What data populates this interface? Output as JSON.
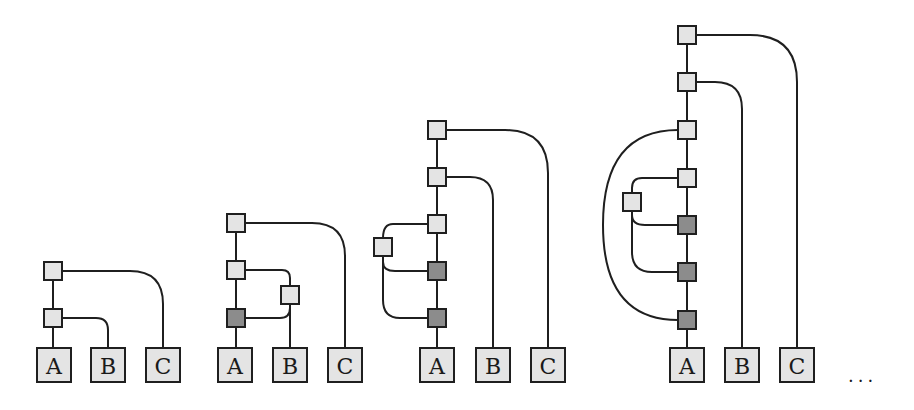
{
  "colors": {
    "stroke": "#1f1f1f",
    "light_node": "#e4e4e4",
    "dark_node": "#8c8c8c",
    "background": "#ffffff"
  },
  "leaf_labels": [
    "A",
    "B",
    "C"
  ],
  "continuation": "...",
  "node_size": 18,
  "leaf_size": 34,
  "leaf_y": 348,
  "diagrams": [
    {
      "id": "d1",
      "leaves": [
        {
          "label": "A",
          "cx": 54
        },
        {
          "label": "B",
          "cx": 108
        },
        {
          "label": "C",
          "cx": 163
        }
      ],
      "nodes": [
        {
          "id": "n1",
          "cx": 53,
          "cy": 271,
          "shade": "light"
        },
        {
          "id": "n2",
          "cx": 53,
          "cy": 318,
          "shade": "light"
        }
      ],
      "edges": [
        "M53,271 L53,348",
        "M62,271 L130,271 Q163,271 163,304 L163,348",
        "M62,318 L96,318 Q108,318 108,330 L108,348"
      ]
    },
    {
      "id": "d2",
      "leaves": [
        {
          "label": "A",
          "cx": 235
        },
        {
          "label": "B",
          "cx": 290
        },
        {
          "label": "C",
          "cx": 345
        }
      ],
      "nodes": [
        {
          "id": "n1",
          "cx": 236,
          "cy": 223,
          "shade": "light"
        },
        {
          "id": "n2",
          "cx": 236,
          "cy": 270,
          "shade": "light"
        },
        {
          "id": "n3",
          "cx": 290,
          "cy": 295,
          "shade": "light"
        },
        {
          "id": "n4",
          "cx": 236,
          "cy": 318,
          "shade": "dark"
        }
      ],
      "edges": [
        "M236,223 L236,348",
        "M245,223 L312,223 Q345,223 345,256 L345,348",
        "M245,270 L282,270 Q290,270 290,278 L290,348",
        "M245,318 L280,318 Q290,318 290,308"
      ]
    },
    {
      "id": "d3",
      "leaves": [
        {
          "label": "A",
          "cx": 437
        },
        {
          "label": "B",
          "cx": 493
        },
        {
          "label": "C",
          "cx": 548
        }
      ],
      "nodes": [
        {
          "id": "n1",
          "cx": 437,
          "cy": 130,
          "shade": "light"
        },
        {
          "id": "n2",
          "cx": 437,
          "cy": 177,
          "shade": "light"
        },
        {
          "id": "n3",
          "cx": 437,
          "cy": 224,
          "shade": "light"
        },
        {
          "id": "n4",
          "cx": 383,
          "cy": 247,
          "shade": "light"
        },
        {
          "id": "n5",
          "cx": 437,
          "cy": 271,
          "shade": "dark"
        },
        {
          "id": "n6",
          "cx": 437,
          "cy": 318,
          "shade": "dark"
        }
      ],
      "edges": [
        "M437,130 L437,348",
        "M446,130 L505,130 Q548,130 548,173 L548,348",
        "M446,177 L470,177 Q493,177 493,200 L493,348",
        "M428,224 L393,224 Q383,224 383,238",
        "M383,256 L383,262 Q383,271 395,271 L428,271",
        "M383,256 L383,300 Q383,318 400,318 L428,318"
      ]
    },
    {
      "id": "d4",
      "leaves": [
        {
          "label": "A",
          "cx": 687
        },
        {
          "label": "B",
          "cx": 742
        },
        {
          "label": "C",
          "cx": 797
        }
      ],
      "nodes": [
        {
          "id": "n1",
          "cx": 687,
          "cy": 35,
          "shade": "light"
        },
        {
          "id": "n2",
          "cx": 687,
          "cy": 82,
          "shade": "light"
        },
        {
          "id": "n3",
          "cx": 687,
          "cy": 130,
          "shade": "light"
        },
        {
          "id": "n4",
          "cx": 687,
          "cy": 178,
          "shade": "light"
        },
        {
          "id": "n5",
          "cx": 632,
          "cy": 202,
          "shade": "light"
        },
        {
          "id": "n6",
          "cx": 687,
          "cy": 225,
          "shade": "dark"
        },
        {
          "id": "n7",
          "cx": 687,
          "cy": 272,
          "shade": "dark"
        },
        {
          "id": "n8",
          "cx": 687,
          "cy": 320,
          "shade": "dark"
        }
      ],
      "edges": [
        "M687,35 L687,348",
        "M696,35 L750,35 Q797,35 797,82 L797,348",
        "M696,82 L715,82 Q742,82 742,109 L742,348",
        "M678,130 Q603,130 603,225 Q603,320 678,320",
        "M678,178 L642,178 Q632,178 632,188 L632,193",
        "M632,211 L632,215 Q632,225 645,225 L678,225",
        "M632,211 L632,252 Q632,272 652,272 L678,272"
      ]
    }
  ]
}
